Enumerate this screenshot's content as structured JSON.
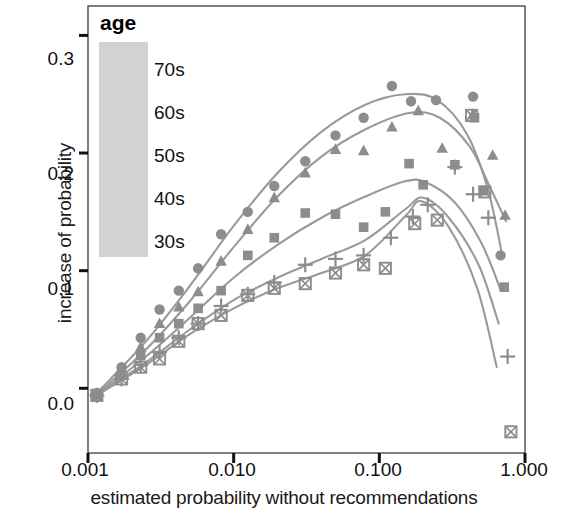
{
  "chart_data": {
    "type": "scatter",
    "title": "",
    "xlabel": "estimated probability without recommendations",
    "ylabel": "increase of probability",
    "xscale": "log",
    "xlim": [
      0.001,
      1.0
    ],
    "ylim": [
      -0.055,
      0.325
    ],
    "xticks": [
      0.001,
      0.01,
      0.1,
      1.0
    ],
    "xtick_labels": [
      "0.001",
      "0.010",
      "0.100",
      "1.000"
    ],
    "yticks": [
      0.0,
      0.1,
      0.2,
      0.3
    ],
    "ytick_labels": [
      "0.0",
      "0.1",
      "0.2",
      "0.3"
    ],
    "grid": false,
    "legend_title": "age",
    "legend_position": "top-left-inside",
    "marker_color": "#8d8d8d",
    "line_color": "#9a9a9a",
    "series": [
      {
        "name": "70s",
        "marker": "circle",
        "points": [
          {
            "x": 0.00115,
            "y": -0.004
          },
          {
            "x": 0.0017,
            "y": 0.018
          },
          {
            "x": 0.0023,
            "y": 0.043
          },
          {
            "x": 0.0031,
            "y": 0.067
          },
          {
            "x": 0.0042,
            "y": 0.083
          },
          {
            "x": 0.0057,
            "y": 0.102
          },
          {
            "x": 0.0082,
            "y": 0.131
          },
          {
            "x": 0.0125,
            "y": 0.15
          },
          {
            "x": 0.019,
            "y": 0.172
          },
          {
            "x": 0.031,
            "y": 0.193
          },
          {
            "x": 0.05,
            "y": 0.215
          },
          {
            "x": 0.078,
            "y": 0.23
          },
          {
            "x": 0.122,
            "y": 0.257
          },
          {
            "x": 0.165,
            "y": 0.244
          },
          {
            "x": 0.245,
            "y": 0.245
          },
          {
            "x": 0.44,
            "y": 0.248
          },
          {
            "x": 0.68,
            "y": 0.113
          }
        ],
        "curve": [
          {
            "x": 0.00115,
            "y": -0.004
          },
          {
            "x": 0.0025,
            "y": 0.04
          },
          {
            "x": 0.005,
            "y": 0.087
          },
          {
            "x": 0.01,
            "y": 0.138
          },
          {
            "x": 0.02,
            "y": 0.183
          },
          {
            "x": 0.04,
            "y": 0.218
          },
          {
            "x": 0.08,
            "y": 0.241
          },
          {
            "x": 0.15,
            "y": 0.25
          },
          {
            "x": 0.25,
            "y": 0.245
          },
          {
            "x": 0.4,
            "y": 0.216
          },
          {
            "x": 0.56,
            "y": 0.168
          },
          {
            "x": 0.7,
            "y": 0.112
          }
        ]
      },
      {
        "name": "60s",
        "marker": "triangle",
        "points": [
          {
            "x": 0.00115,
            "y": -0.005
          },
          {
            "x": 0.0017,
            "y": 0.014
          },
          {
            "x": 0.0023,
            "y": 0.035
          },
          {
            "x": 0.0031,
            "y": 0.055
          },
          {
            "x": 0.0042,
            "y": 0.069
          },
          {
            "x": 0.0057,
            "y": 0.082
          },
          {
            "x": 0.0082,
            "y": 0.108
          },
          {
            "x": 0.0125,
            "y": 0.135
          },
          {
            "x": 0.019,
            "y": 0.162
          },
          {
            "x": 0.031,
            "y": 0.183
          },
          {
            "x": 0.05,
            "y": 0.203
          },
          {
            "x": 0.078,
            "y": 0.202
          },
          {
            "x": 0.122,
            "y": 0.222
          },
          {
            "x": 0.185,
            "y": 0.236
          },
          {
            "x": 0.27,
            "y": 0.204
          },
          {
            "x": 0.44,
            "y": 0.233
          },
          {
            "x": 0.6,
            "y": 0.198
          },
          {
            "x": 0.73,
            "y": 0.147
          }
        ],
        "curve": [
          {
            "x": 0.00115,
            "y": -0.005
          },
          {
            "x": 0.0025,
            "y": 0.033
          },
          {
            "x": 0.005,
            "y": 0.074
          },
          {
            "x": 0.01,
            "y": 0.12
          },
          {
            "x": 0.02,
            "y": 0.163
          },
          {
            "x": 0.04,
            "y": 0.197
          },
          {
            "x": 0.08,
            "y": 0.22
          },
          {
            "x": 0.16,
            "y": 0.234
          },
          {
            "x": 0.26,
            "y": 0.23
          },
          {
            "x": 0.42,
            "y": 0.205
          },
          {
            "x": 0.58,
            "y": 0.17
          },
          {
            "x": 0.74,
            "y": 0.142
          }
        ]
      },
      {
        "name": "50s",
        "marker": "square",
        "points": [
          {
            "x": 0.00115,
            "y": -0.006
          },
          {
            "x": 0.0017,
            "y": 0.012
          },
          {
            "x": 0.0023,
            "y": 0.028
          },
          {
            "x": 0.0031,
            "y": 0.043
          },
          {
            "x": 0.0042,
            "y": 0.055
          },
          {
            "x": 0.0057,
            "y": 0.068
          },
          {
            "x": 0.0082,
            "y": 0.083
          },
          {
            "x": 0.0125,
            "y": 0.113
          },
          {
            "x": 0.019,
            "y": 0.128
          },
          {
            "x": 0.031,
            "y": 0.149
          },
          {
            "x": 0.05,
            "y": 0.148
          },
          {
            "x": 0.078,
            "y": 0.137
          },
          {
            "x": 0.11,
            "y": 0.15
          },
          {
            "x": 0.16,
            "y": 0.191
          },
          {
            "x": 0.2,
            "y": 0.173
          },
          {
            "x": 0.33,
            "y": 0.19
          },
          {
            "x": 0.45,
            "y": 0.23
          },
          {
            "x": 0.52,
            "y": 0.168
          },
          {
            "x": 0.72,
            "y": 0.086
          }
        ],
        "curve": [
          {
            "x": 0.00115,
            "y": -0.006
          },
          {
            "x": 0.0025,
            "y": 0.027
          },
          {
            "x": 0.005,
            "y": 0.06
          },
          {
            "x": 0.01,
            "y": 0.094
          },
          {
            "x": 0.02,
            "y": 0.122
          },
          {
            "x": 0.04,
            "y": 0.145
          },
          {
            "x": 0.08,
            "y": 0.163
          },
          {
            "x": 0.15,
            "y": 0.176
          },
          {
            "x": 0.21,
            "y": 0.175
          },
          {
            "x": 0.33,
            "y": 0.158
          },
          {
            "x": 0.5,
            "y": 0.124
          },
          {
            "x": 0.68,
            "y": 0.084
          }
        ]
      },
      {
        "name": "40s",
        "marker": "plus",
        "points": [
          {
            "x": 0.00115,
            "y": -0.006
          },
          {
            "x": 0.0017,
            "y": 0.008
          },
          {
            "x": 0.0023,
            "y": 0.02
          },
          {
            "x": 0.0031,
            "y": 0.031
          },
          {
            "x": 0.0042,
            "y": 0.043
          },
          {
            "x": 0.0057,
            "y": 0.055
          },
          {
            "x": 0.0082,
            "y": 0.07
          },
          {
            "x": 0.0125,
            "y": 0.08
          },
          {
            "x": 0.019,
            "y": 0.09
          },
          {
            "x": 0.031,
            "y": 0.105
          },
          {
            "x": 0.05,
            "y": 0.11
          },
          {
            "x": 0.078,
            "y": 0.113
          },
          {
            "x": 0.12,
            "y": 0.128
          },
          {
            "x": 0.17,
            "y": 0.146
          },
          {
            "x": 0.215,
            "y": 0.156
          },
          {
            "x": 0.33,
            "y": 0.188
          },
          {
            "x": 0.44,
            "y": 0.165
          },
          {
            "x": 0.56,
            "y": 0.145
          },
          {
            "x": 0.76,
            "y": 0.027
          }
        ],
        "curve": [
          {
            "x": 0.00115,
            "y": -0.006
          },
          {
            "x": 0.0025,
            "y": 0.022
          },
          {
            "x": 0.005,
            "y": 0.05
          },
          {
            "x": 0.01,
            "y": 0.075
          },
          {
            "x": 0.02,
            "y": 0.094
          },
          {
            "x": 0.04,
            "y": 0.11
          },
          {
            "x": 0.08,
            "y": 0.126
          },
          {
            "x": 0.15,
            "y": 0.152
          },
          {
            "x": 0.2,
            "y": 0.162
          },
          {
            "x": 0.3,
            "y": 0.145
          },
          {
            "x": 0.48,
            "y": 0.105
          },
          {
            "x": 0.66,
            "y": 0.055
          }
        ]
      },
      {
        "name": "30s",
        "marker": "square-x",
        "points": [
          {
            "x": 0.00115,
            "y": -0.006
          },
          {
            "x": 0.0017,
            "y": 0.008
          },
          {
            "x": 0.0023,
            "y": 0.018
          },
          {
            "x": 0.0031,
            "y": 0.025
          },
          {
            "x": 0.0042,
            "y": 0.04
          },
          {
            "x": 0.0057,
            "y": 0.055
          },
          {
            "x": 0.0082,
            "y": 0.062
          },
          {
            "x": 0.0125,
            "y": 0.079
          },
          {
            "x": 0.019,
            "y": 0.085
          },
          {
            "x": 0.031,
            "y": 0.089
          },
          {
            "x": 0.05,
            "y": 0.098
          },
          {
            "x": 0.078,
            "y": 0.105
          },
          {
            "x": 0.11,
            "y": 0.102
          },
          {
            "x": 0.175,
            "y": 0.14
          },
          {
            "x": 0.25,
            "y": 0.143
          },
          {
            "x": 0.43,
            "y": 0.232
          },
          {
            "x": 0.53,
            "y": 0.167
          },
          {
            "x": 0.8,
            "y": -0.037
          }
        ],
        "curve": [
          {
            "x": 0.00115,
            "y": -0.006
          },
          {
            "x": 0.0025,
            "y": 0.02
          },
          {
            "x": 0.005,
            "y": 0.046
          },
          {
            "x": 0.01,
            "y": 0.068
          },
          {
            "x": 0.02,
            "y": 0.085
          },
          {
            "x": 0.04,
            "y": 0.098
          },
          {
            "x": 0.08,
            "y": 0.113
          },
          {
            "x": 0.15,
            "y": 0.146
          },
          {
            "x": 0.195,
            "y": 0.159
          },
          {
            "x": 0.3,
            "y": 0.137
          },
          {
            "x": 0.47,
            "y": 0.085
          },
          {
            "x": 0.64,
            "y": 0.018
          }
        ]
      }
    ]
  },
  "legend": {
    "title": "age",
    "entries": [
      {
        "label": "70s",
        "marker": "circle"
      },
      {
        "label": "60s",
        "marker": "triangle"
      },
      {
        "label": "50s",
        "marker": "square"
      },
      {
        "label": "40s",
        "marker": "plus"
      },
      {
        "label": "30s",
        "marker": "square-x"
      }
    ]
  },
  "axes": {
    "x_title": "estimated probability without recommendations",
    "y_title": "increase of probability",
    "x_tick_labels": [
      "0.001",
      "0.010",
      "0.100",
      "1.000"
    ],
    "y_tick_labels": [
      "0.0",
      "0.1",
      "0.2",
      "0.3"
    ]
  }
}
